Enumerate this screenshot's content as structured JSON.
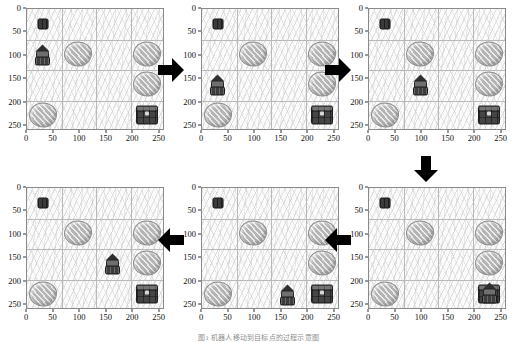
{
  "figure": {
    "caption": "图1 机器人移动到目标点的过程示意图",
    "axis": {
      "x_ticks": [
        0,
        50,
        100,
        150,
        200,
        250
      ],
      "y_ticks": [
        0,
        50,
        100,
        150,
        200,
        250
      ],
      "xlim": [
        0,
        260
      ],
      "ylim": [
        260,
        0
      ],
      "grid_cell_size": 65,
      "grid_lines_x": [
        65,
        130,
        195
      ],
      "grid_lines_y": [
        65,
        130,
        195
      ]
    },
    "colors": {
      "gridline": "#b9b9b9",
      "border": "#8a8a8a",
      "rock": "#b4b4b4",
      "chest": "#454545",
      "agent": "#3d3d3d",
      "arrow": "#000000",
      "background": "#fbfbfb"
    },
    "sprite_names": {
      "rock": "rock-obstacle",
      "chest": "chest-goal",
      "chest_small": "small-chest",
      "agent": "robot-agent"
    },
    "arrows": [
      {
        "name": "arrow-panel1-to-panel2",
        "direction": "right"
      },
      {
        "name": "arrow-panel2-to-panel3",
        "direction": "right"
      },
      {
        "name": "arrow-panel3-to-panel4",
        "direction": "down"
      },
      {
        "name": "arrow-panel4-to-panel5",
        "direction": "left"
      },
      {
        "name": "arrow-panel5-to-panel6",
        "direction": "left"
      }
    ]
  },
  "chart_data": {
    "type": "scatter",
    "title": "机器人移动到目标点的过程示意图",
    "xlabel": "",
    "ylabel": "",
    "xlim": [
      0,
      260
    ],
    "ylim": [
      260,
      0
    ],
    "xticks": [
      0,
      50,
      100,
      150,
      200,
      250
    ],
    "yticks": [
      0,
      50,
      100,
      150,
      200,
      250
    ],
    "grid": true,
    "panels": [
      {
        "index": 1,
        "name": "panel-step-1",
        "objects": [
          {
            "type": "chest_small",
            "x": 30,
            "y": 32
          },
          {
            "type": "agent",
            "x": 30,
            "y": 95
          },
          {
            "type": "rock",
            "x": 97,
            "y": 95
          },
          {
            "type": "rock",
            "x": 227,
            "y": 95
          },
          {
            "type": "rock",
            "x": 227,
            "y": 160
          },
          {
            "type": "rock",
            "x": 30,
            "y": 225
          },
          {
            "type": "chest",
            "x": 227,
            "y": 225
          }
        ]
      },
      {
        "index": 2,
        "name": "panel-step-2",
        "objects": [
          {
            "type": "chest_small",
            "x": 30,
            "y": 32
          },
          {
            "type": "rock",
            "x": 97,
            "y": 95
          },
          {
            "type": "rock",
            "x": 227,
            "y": 95
          },
          {
            "type": "agent",
            "x": 30,
            "y": 160
          },
          {
            "type": "rock",
            "x": 227,
            "y": 160
          },
          {
            "type": "rock",
            "x": 30,
            "y": 225
          },
          {
            "type": "chest",
            "x": 227,
            "y": 225
          }
        ]
      },
      {
        "index": 3,
        "name": "panel-step-3",
        "objects": [
          {
            "type": "chest_small",
            "x": 30,
            "y": 32
          },
          {
            "type": "rock",
            "x": 97,
            "y": 95
          },
          {
            "type": "rock",
            "x": 227,
            "y": 95
          },
          {
            "type": "agent",
            "x": 97,
            "y": 160
          },
          {
            "type": "rock",
            "x": 227,
            "y": 160
          },
          {
            "type": "rock",
            "x": 30,
            "y": 225
          },
          {
            "type": "chest",
            "x": 227,
            "y": 225
          }
        ]
      },
      {
        "index": 4,
        "name": "panel-step-4",
        "objects": [
          {
            "type": "chest_small",
            "x": 30,
            "y": 32
          },
          {
            "type": "rock",
            "x": 97,
            "y": 95
          },
          {
            "type": "rock",
            "x": 227,
            "y": 95
          },
          {
            "type": "agent",
            "x": 162,
            "y": 160
          },
          {
            "type": "rock",
            "x": 227,
            "y": 160
          },
          {
            "type": "rock",
            "x": 30,
            "y": 225
          },
          {
            "type": "chest",
            "x": 227,
            "y": 225
          }
        ]
      },
      {
        "index": 5,
        "name": "panel-step-5",
        "objects": [
          {
            "type": "chest_small",
            "x": 30,
            "y": 32
          },
          {
            "type": "rock",
            "x": 97,
            "y": 95
          },
          {
            "type": "rock",
            "x": 227,
            "y": 95
          },
          {
            "type": "rock",
            "x": 227,
            "y": 160
          },
          {
            "type": "rock",
            "x": 30,
            "y": 225
          },
          {
            "type": "agent",
            "x": 162,
            "y": 225
          },
          {
            "type": "chest",
            "x": 227,
            "y": 225
          }
        ]
      },
      {
        "index": 6,
        "name": "panel-step-6",
        "objects": [
          {
            "type": "chest_small",
            "x": 30,
            "y": 32
          },
          {
            "type": "rock",
            "x": 97,
            "y": 95
          },
          {
            "type": "rock",
            "x": 227,
            "y": 95
          },
          {
            "type": "rock",
            "x": 227,
            "y": 160
          },
          {
            "type": "rock",
            "x": 30,
            "y": 225
          },
          {
            "type": "chest",
            "x": 227,
            "y": 225
          },
          {
            "type": "agent",
            "x": 227,
            "y": 222
          }
        ]
      }
    ]
  }
}
